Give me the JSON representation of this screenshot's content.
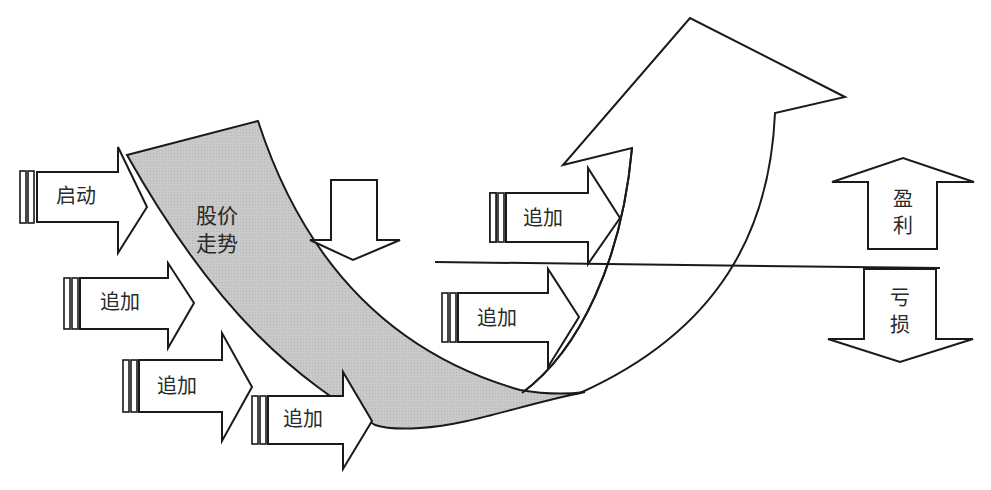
{
  "diagram": {
    "title": "",
    "main_curve": {
      "label": "股价走势",
      "fill_color": "#c8c8c8"
    },
    "arrows": [
      {
        "id": "start",
        "label": "启动",
        "direction": "right"
      },
      {
        "id": "add-1",
        "label": "追加",
        "direction": "right"
      },
      {
        "id": "add-2",
        "label": "追加",
        "direction": "right"
      },
      {
        "id": "add-3",
        "label": "追加",
        "direction": "right"
      },
      {
        "id": "add-4",
        "label": "追加",
        "direction": "right"
      },
      {
        "id": "add-5",
        "label": "追加",
        "direction": "right"
      }
    ],
    "legend": {
      "profit_label": "盈利",
      "loss_label": "亏损"
    },
    "baseline": "horizontal line separating profit (above) and loss (below)",
    "colors": {
      "stroke": "#1a1a1a",
      "shade": "#c8c8c8",
      "background": "#ffffff"
    }
  }
}
